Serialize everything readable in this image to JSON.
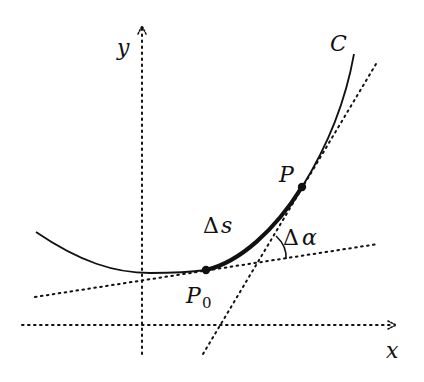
{
  "figure": {
    "colors": {
      "ink": "#111111",
      "background": "#ffffff"
    },
    "axes": {
      "x_label": "x",
      "y_label": "y"
    },
    "curve": {
      "label": "C"
    },
    "points": [
      {
        "id": "P0",
        "label_main": "P",
        "label_sub": "0"
      },
      {
        "id": "P",
        "label_main": "P"
      }
    ],
    "annotations": {
      "arc_length": {
        "delta": "Δ",
        "symbol": "s"
      },
      "angle": {
        "delta": "Δ",
        "symbol": "α"
      }
    }
  }
}
